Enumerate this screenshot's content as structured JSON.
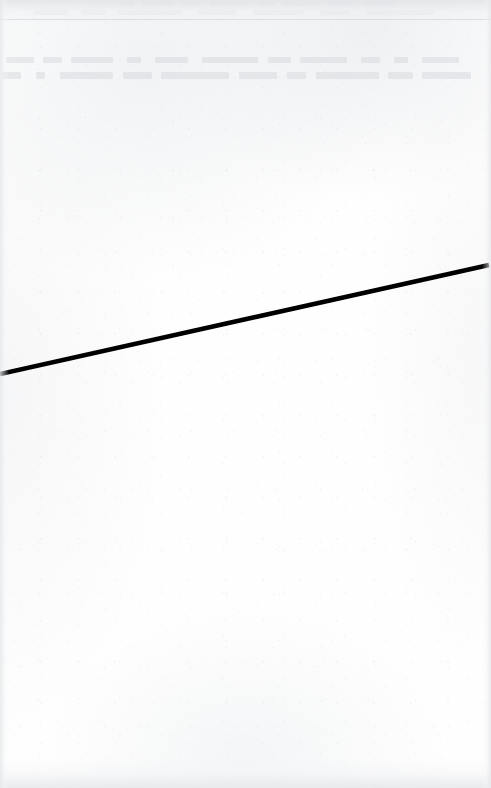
{
  "document": {
    "kind": "scanned-page",
    "page_width": 491,
    "page_height": 788,
    "background_color": "#fefefe",
    "visible_text": "",
    "caption": ""
  },
  "chart_data": {
    "type": "line",
    "title": "",
    "subtitle": "",
    "xlabel": "",
    "ylabel": "",
    "grid": false,
    "legend": "none",
    "xlim": [
      0,
      491
    ],
    "ylim": [
      788,
      0
    ],
    "axis_ticks": {
      "x": [],
      "y": []
    },
    "annotations": [],
    "series": [
      {
        "name": "diagonal-rule",
        "color": "#000000",
        "line_width": 4.6,
        "x": [
          0,
          489
        ],
        "y": [
          374,
          265
        ]
      }
    ]
  },
  "marks": {
    "diagonal_rule": {
      "color": "#000000",
      "stroke_width": 4.6,
      "start_x": 0,
      "start_y": 374,
      "end_x": 489,
      "end_y": 265,
      "cap": "butt"
    },
    "top_hairline": {
      "color": "#d6d9dd",
      "y": 19,
      "thickness": 1
    }
  },
  "artifacts": {
    "label": "scan-artifacts",
    "edge_shading_color": "#e5e7ea",
    "speckle_color": "#cdd0d4",
    "ghost_text_color": "#cfd2d7",
    "ghost_rows": [
      {
        "top": 57,
        "height": 6
      },
      {
        "top": 72,
        "height": 7
      }
    ]
  }
}
